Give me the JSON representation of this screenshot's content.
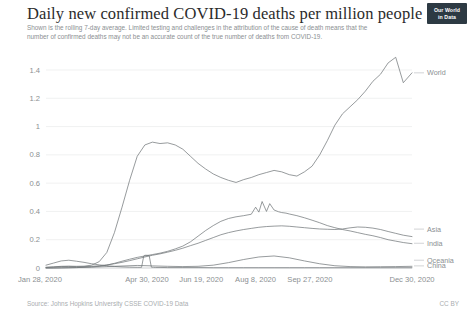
{
  "header": {
    "title": "Daily new confirmed COVID-19 deaths per million people",
    "subtitle": "Shown is the rolling 7-day average. Limited testing and challenges in the attribution of the cause of death means that the number of confirmed deaths may not be an accurate count of the true number of deaths from COVID-19.",
    "logo_line1": "Our World",
    "logo_line2": "in Data"
  },
  "footer": {
    "source": "Source: Johns Hopkins University CSSE COVID-19 Data",
    "license": "CC BY"
  },
  "colors": {
    "line": "#6e7376",
    "grid": "#e6e7e8",
    "text_muted": "#8b8f92",
    "title": "#2b2b2b",
    "logo_bg": "#2d3a43"
  },
  "chart_data": {
    "type": "line",
    "title": "Daily new confirmed COVID-19 deaths per million people",
    "subtitle": "Shown is the rolling 7-day average. Limited testing and challenges in the attribution of the cause of death means that the number of confirmed deaths may not be an accurate count of the true number of deaths from COVID-19.",
    "xlabel": "",
    "ylabel": "",
    "ylim": [
      0,
      1.5
    ],
    "yticks": [
      0,
      0.2,
      0.4,
      0.6,
      0.8,
      1,
      1.2,
      1.4
    ],
    "ytick_labels": [
      "0",
      "0.2",
      "0.4",
      "0.6",
      "0.8",
      "1",
      "1.2",
      "1.4"
    ],
    "xlim": [
      0,
      337
    ],
    "xticks": [
      0,
      93,
      143,
      193,
      243,
      337
    ],
    "xtick_labels": [
      "Jan 28, 2020",
      "Apr 30, 2020",
      "Jun 19, 2020",
      "Aug 8, 2020",
      "Sep 27, 2020",
      "Dec 30, 2020"
    ],
    "grid": true,
    "legend_position": "right",
    "legend": [
      "World",
      "Asia",
      "India",
      "Oceania",
      "China"
    ],
    "series": [
      {
        "name": "World",
        "end_value": 1.38,
        "peak_value": 1.49,
        "x": [
          0,
          7,
          14,
          21,
          28,
          35,
          42,
          49,
          56,
          63,
          70,
          77,
          84,
          91,
          98,
          105,
          112,
          119,
          126,
          133,
          140,
          147,
          154,
          161,
          168,
          175,
          182,
          189,
          196,
          203,
          210,
          217,
          224,
          231,
          238,
          245,
          252,
          259,
          266,
          273,
          280,
          287,
          294,
          301,
          308,
          315,
          322,
          329,
          337
        ],
        "values": [
          0.005,
          0.008,
          0.012,
          0.013,
          0.012,
          0.013,
          0.02,
          0.045,
          0.11,
          0.25,
          0.43,
          0.62,
          0.79,
          0.87,
          0.89,
          0.88,
          0.885,
          0.87,
          0.84,
          0.79,
          0.74,
          0.7,
          0.665,
          0.64,
          0.62,
          0.605,
          0.625,
          0.64,
          0.66,
          0.675,
          0.69,
          0.68,
          0.66,
          0.65,
          0.68,
          0.72,
          0.8,
          0.9,
          1.01,
          1.09,
          1.14,
          1.19,
          1.25,
          1.32,
          1.37,
          1.45,
          1.49,
          1.31,
          1.38
        ]
      },
      {
        "name": "Asia",
        "end_value": 0.22,
        "peak_value": 0.3,
        "x": [
          0,
          7,
          14,
          21,
          28,
          35,
          42,
          49,
          56,
          63,
          70,
          77,
          84,
          91,
          98,
          105,
          112,
          119,
          126,
          133,
          140,
          147,
          154,
          161,
          168,
          175,
          182,
          189,
          196,
          203,
          210,
          217,
          224,
          231,
          238,
          245,
          252,
          259,
          266,
          273,
          280,
          287,
          294,
          301,
          308,
          315,
          322,
          329,
          337
        ],
        "values": [
          0.004,
          0.007,
          0.01,
          0.011,
          0.01,
          0.01,
          0.012,
          0.016,
          0.022,
          0.03,
          0.04,
          0.052,
          0.065,
          0.078,
          0.09,
          0.1,
          0.112,
          0.125,
          0.14,
          0.158,
          0.175,
          0.195,
          0.215,
          0.235,
          0.25,
          0.262,
          0.272,
          0.28,
          0.288,
          0.293,
          0.296,
          0.298,
          0.295,
          0.29,
          0.285,
          0.28,
          0.276,
          0.274,
          0.272,
          0.276,
          0.284,
          0.29,
          0.288,
          0.282,
          0.272,
          0.258,
          0.245,
          0.232,
          0.222
        ]
      },
      {
        "name": "India",
        "end_value": 0.17,
        "peak_value": 0.48,
        "x": [
          0,
          7,
          14,
          21,
          28,
          35,
          42,
          49,
          56,
          63,
          70,
          77,
          84,
          91,
          98,
          105,
          112,
          119,
          126,
          133,
          140,
          147,
          154,
          161,
          168,
          175,
          182,
          189,
          193,
          196,
          199,
          203,
          206,
          210,
          214,
          217,
          221,
          224,
          231,
          238,
          245,
          252,
          259,
          266,
          273,
          280,
          287,
          294,
          301,
          308,
          315,
          322,
          329,
          337
        ],
        "values": [
          0.0,
          0.0,
          0.001,
          0.002,
          0.003,
          0.005,
          0.008,
          0.012,
          0.02,
          0.033,
          0.048,
          0.062,
          0.075,
          0.085,
          0.095,
          0.105,
          0.118,
          0.135,
          0.155,
          0.185,
          0.225,
          0.265,
          0.3,
          0.33,
          0.35,
          0.362,
          0.37,
          0.38,
          0.43,
          0.395,
          0.47,
          0.4,
          0.455,
          0.41,
          0.398,
          0.392,
          0.388,
          0.382,
          0.37,
          0.355,
          0.338,
          0.32,
          0.3,
          0.285,
          0.272,
          0.262,
          0.25,
          0.238,
          0.228,
          0.215,
          0.2,
          0.19,
          0.18,
          0.172
        ]
      },
      {
        "name": "Oceania",
        "end_value": 0.012,
        "peak_value": 0.085,
        "x": [
          0,
          14,
          28,
          42,
          56,
          70,
          84,
          98,
          112,
          126,
          140,
          154,
          168,
          182,
          196,
          210,
          224,
          238,
          252,
          266,
          280,
          294,
          308,
          322,
          337
        ],
        "values": [
          0.0,
          0.001,
          0.003,
          0.006,
          0.01,
          0.014,
          0.018,
          0.015,
          0.012,
          0.01,
          0.012,
          0.02,
          0.038,
          0.06,
          0.078,
          0.085,
          0.072,
          0.05,
          0.03,
          0.016,
          0.01,
          0.008,
          0.009,
          0.01,
          0.012
        ]
      },
      {
        "name": "China",
        "end_value": 0.002,
        "peak_value": 0.09,
        "x": [
          0,
          7,
          14,
          21,
          28,
          35,
          42,
          49,
          56,
          63,
          70,
          77,
          84,
          88,
          90,
          91,
          93,
          95,
          97,
          99,
          101,
          105,
          112,
          126,
          140,
          154,
          168,
          182,
          196,
          210,
          224,
          238,
          252,
          266,
          280,
          294,
          308,
          322,
          337
        ],
        "values": [
          0.02,
          0.035,
          0.05,
          0.055,
          0.048,
          0.04,
          0.03,
          0.022,
          0.016,
          0.011,
          0.008,
          0.006,
          0.005,
          0.005,
          0.085,
          0.09,
          0.09,
          0.088,
          0.006,
          0.005,
          0.004,
          0.004,
          0.003,
          0.003,
          0.003,
          0.002,
          0.002,
          0.002,
          0.002,
          0.002,
          0.002,
          0.002,
          0.002,
          0.002,
          0.002,
          0.002,
          0.002,
          0.002,
          0.002
        ]
      }
    ],
    "legend_positions": {
      "World": 1.38,
      "Asia": 0.275,
      "India": 0.175,
      "Oceania": 0.055,
      "China": 0.015
    }
  }
}
